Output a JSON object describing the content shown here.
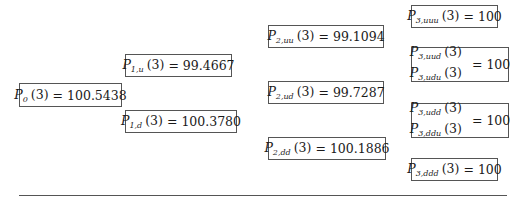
{
  "tree": {
    "period": "3",
    "nodes": [
      {
        "id": "P0",
        "labels": [
          {
            "sym": "P",
            "sub": "0",
            "arg": "(3)"
          }
        ],
        "value": "100.5438",
        "box": [
          19,
          83,
          103,
          24
        ]
      },
      {
        "id": "P1u",
        "labels": [
          {
            "sym": "P",
            "sub": "1,u",
            "arg": "(3)"
          }
        ],
        "value": "99.4667",
        "box": [
          125,
          54,
          107,
          23
        ]
      },
      {
        "id": "P1d",
        "labels": [
          {
            "sym": "P",
            "sub": "1,d",
            "arg": "(3)"
          }
        ],
        "value": "100.3780",
        "box": [
          125,
          110,
          112,
          23
        ]
      },
      {
        "id": "P2uu",
        "labels": [
          {
            "sym": "P",
            "sub": "2,uu",
            "arg": "(3)"
          }
        ],
        "value": "99.1094",
        "box": [
          268,
          25,
          116,
          23
        ]
      },
      {
        "id": "P2ud",
        "labels": [
          {
            "sym": "P",
            "sub": "2,ud",
            "arg": "(3)"
          }
        ],
        "value": "99.7287",
        "box": [
          268,
          81,
          116,
          23
        ]
      },
      {
        "id": "P2dd",
        "labels": [
          {
            "sym": "P",
            "sub": "2,dd",
            "arg": "(3)"
          }
        ],
        "value": "100.1886",
        "box": [
          268,
          137,
          118,
          23
        ]
      },
      {
        "id": "P3uuu",
        "labels": [
          {
            "sym": "P",
            "sub": "3,uuu",
            "arg": "(3)"
          }
        ],
        "value": "100",
        "box": [
          411,
          5,
          87,
          23
        ]
      },
      {
        "id": "P3uud",
        "labels": [
          {
            "sym": "P",
            "sub": "3,uud",
            "arg": "(3)"
          },
          {
            "sym": "P",
            "sub": "3,udu",
            "arg": "(3)"
          }
        ],
        "value": "100",
        "box": [
          411,
          47,
          98,
          35
        ]
      },
      {
        "id": "P3udd",
        "labels": [
          {
            "sym": "P",
            "sub": "3,udd",
            "arg": "(3)"
          },
          {
            "sym": "P",
            "sub": "3,ddu",
            "arg": "(3)"
          }
        ],
        "value": "100",
        "box": [
          411,
          103,
          98,
          35
        ]
      },
      {
        "id": "P3ddd",
        "labels": [
          {
            "sym": "P",
            "sub": "3,ddd",
            "arg": "(3)"
          }
        ],
        "value": "100",
        "box": [
          411,
          158,
          87,
          23
        ]
      }
    ],
    "equals": "="
  }
}
